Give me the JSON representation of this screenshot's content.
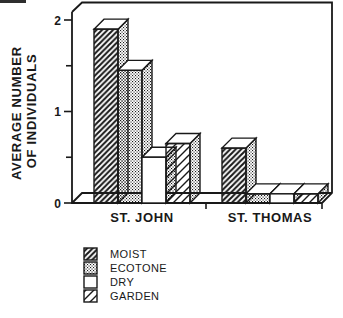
{
  "figure": {
    "background": "#ffffff"
  },
  "chart_data": {
    "type": "bar",
    "style": "pseudo-3d-grouped-bars",
    "title": "",
    "xlabel": "",
    "ylabel_lines": [
      "AVERAGE NUMBER",
      "OF INDIVIDUALS"
    ],
    "categories": [
      "ST. JOHN",
      "ST. THOMAS"
    ],
    "series": [
      {
        "name": "MOIST",
        "pattern": "hatch-dense",
        "values": [
          1.9,
          0.6
        ]
      },
      {
        "name": "ECOTONE",
        "pattern": "stipple",
        "values": [
          1.45,
          0.1
        ]
      },
      {
        "name": "DRY",
        "pattern": "plain",
        "values": [
          0.5,
          0.1
        ]
      },
      {
        "name": "GARDEN",
        "pattern": "hatch-sparse",
        "values": [
          0.65,
          0.1
        ]
      }
    ],
    "ylim": [
      0,
      2
    ],
    "yticks": [
      {
        "value": 0,
        "label": "0"
      },
      {
        "value": 0.5,
        "label": ""
      },
      {
        "value": 1,
        "label": "1"
      },
      {
        "value": 1.5,
        "label": ""
      },
      {
        "value": 2,
        "label": "2"
      }
    ],
    "grid": false,
    "legend": {
      "position": "bottom-left"
    },
    "colors": {
      "ink": "#191919",
      "paper": "#ffffff"
    }
  }
}
